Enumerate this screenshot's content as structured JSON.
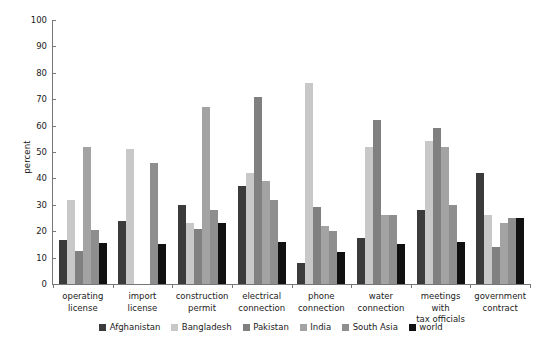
{
  "chart_data": {
    "type": "bar",
    "title": "",
    "xlabel": "",
    "ylabel": "percent",
    "ylim": [
      0,
      100
    ],
    "ytick_step": 10,
    "yticks": [
      0,
      10,
      20,
      30,
      40,
      50,
      60,
      70,
      80,
      90,
      100
    ],
    "grid": false,
    "legend_position": "bottom-center",
    "categories": [
      "operating license",
      "import license",
      "construction permit",
      "electrical connection",
      "phone connection",
      "water connection",
      "meetings with tax officials",
      "government contract"
    ],
    "category_label_lines": [
      [
        "operating",
        "license"
      ],
      [
        "import license",
        ""
      ],
      [
        "construction",
        "permit"
      ],
      [
        "electrical",
        "connection"
      ],
      [
        "phone",
        "connection"
      ],
      [
        "water",
        "connection"
      ],
      [
        "meetings with",
        "tax officials"
      ],
      [
        "government",
        "contract"
      ]
    ],
    "series": [
      {
        "name": "Afghanistan",
        "color": "#3b3b3b",
        "values": [
          16.5,
          24,
          30,
          37,
          8,
          17.5,
          28,
          42
        ]
      },
      {
        "name": "Bangladesh",
        "color": "#c8c8c8",
        "values": [
          32,
          51,
          23,
          42,
          76,
          52,
          54,
          26
        ]
      },
      {
        "name": "Pakistan",
        "color": "#808080",
        "values": [
          12.5,
          0,
          21,
          71,
          29,
          62,
          59,
          14
        ]
      },
      {
        "name": "India",
        "color": "#a3a3a3",
        "values": [
          52,
          0,
          67,
          39,
          22,
          26,
          52,
          23
        ]
      },
      {
        "name": "South Asia",
        "color": "#8e8e8e",
        "values": [
          20.5,
          46,
          28,
          32,
          20,
          26,
          30,
          25
        ]
      },
      {
        "name": "world",
        "color": "#111111",
        "values": [
          15.5,
          15,
          23,
          16,
          12,
          15,
          16,
          25
        ]
      }
    ]
  },
  "legend": {
    "items": [
      {
        "label": "Afghanistan",
        "color": "#3b3b3b"
      },
      {
        "label": "Bangladesh",
        "color": "#c8c8c8"
      },
      {
        "label": "Pakistan",
        "color": "#808080"
      },
      {
        "label": "India",
        "color": "#a3a3a3"
      },
      {
        "label": "South Asia",
        "color": "#8e8e8e"
      },
      {
        "label": "world",
        "color": "#111111"
      }
    ]
  }
}
